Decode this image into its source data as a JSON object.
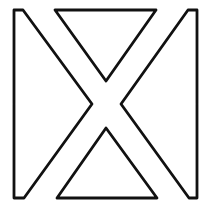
{
  "figure": {
    "stroke_color": "#111111",
    "background": "#ffffff",
    "shapes": [
      {
        "name": "left-shape",
        "points": "14,10 23,10 92,104 24,198 14,198"
      },
      {
        "name": "top-triangle",
        "points": "55,10 156,10 106,81"
      },
      {
        "name": "right-shape",
        "points": "197,10 188,10 121,104 189,198 197,198"
      },
      {
        "name": "bottom-triangle",
        "points": "57,198 157,198 106,128"
      }
    ]
  }
}
